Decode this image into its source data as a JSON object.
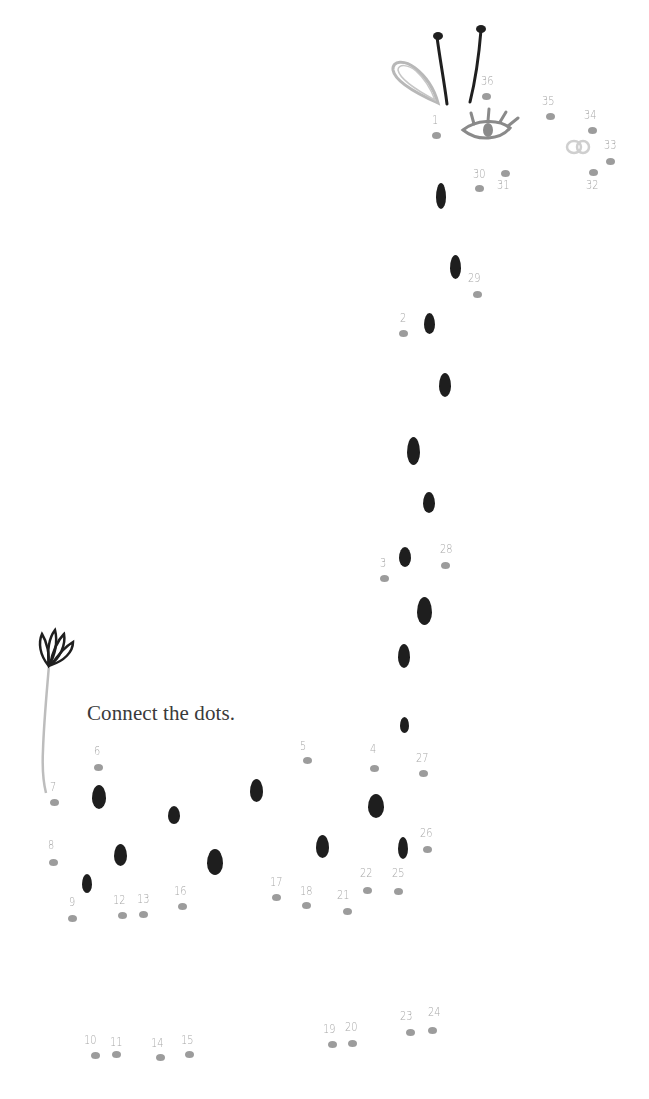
{
  "instruction": "Connect the dots.",
  "colors": {
    "dot": "#9c9c9c",
    "number": "#a8a8a8",
    "spot": "#1e1e1e",
    "text": "#3a3a3a",
    "background": "#ffffff"
  },
  "dots": [
    {
      "n": "1",
      "x": 436,
      "y": 135,
      "lx": 432,
      "ly": 113
    },
    {
      "n": "2",
      "x": 403,
      "y": 333,
      "lx": 400,
      "ly": 311
    },
    {
      "n": "3",
      "x": 384,
      "y": 578,
      "lx": 380,
      "ly": 556
    },
    {
      "n": "4",
      "x": 374,
      "y": 768,
      "lx": 370,
      "ly": 742
    },
    {
      "n": "5",
      "x": 307,
      "y": 760,
      "lx": 300,
      "ly": 739
    },
    {
      "n": "6",
      "x": 98,
      "y": 767,
      "lx": 94,
      "ly": 744
    },
    {
      "n": "7",
      "x": 54,
      "y": 802,
      "lx": 50,
      "ly": 780
    },
    {
      "n": "8",
      "x": 53,
      "y": 862,
      "lx": 48,
      "ly": 838
    },
    {
      "n": "9",
      "x": 72,
      "y": 918,
      "lx": 69,
      "ly": 895
    },
    {
      "n": "10",
      "x": 95,
      "y": 1055,
      "lx": 84,
      "ly": 1033
    },
    {
      "n": "11",
      "x": 116,
      "y": 1054,
      "lx": 110,
      "ly": 1035
    },
    {
      "n": "12",
      "x": 122,
      "y": 915,
      "lx": 113,
      "ly": 893
    },
    {
      "n": "13",
      "x": 143,
      "y": 914,
      "lx": 137,
      "ly": 892
    },
    {
      "n": "14",
      "x": 160,
      "y": 1057,
      "lx": 151,
      "ly": 1036
    },
    {
      "n": "15",
      "x": 189,
      "y": 1054,
      "lx": 181,
      "ly": 1033
    },
    {
      "n": "16",
      "x": 182,
      "y": 906,
      "lx": 174,
      "ly": 884
    },
    {
      "n": "17",
      "x": 276,
      "y": 897,
      "lx": 270,
      "ly": 875
    },
    {
      "n": "18",
      "x": 306,
      "y": 905,
      "lx": 300,
      "ly": 884
    },
    {
      "n": "19",
      "x": 332,
      "y": 1044,
      "lx": 323,
      "ly": 1022
    },
    {
      "n": "20",
      "x": 352,
      "y": 1043,
      "lx": 345,
      "ly": 1020
    },
    {
      "n": "21",
      "x": 347,
      "y": 911,
      "lx": 337,
      "ly": 888
    },
    {
      "n": "22",
      "x": 367,
      "y": 890,
      "lx": 360,
      "ly": 866
    },
    {
      "n": "23",
      "x": 410,
      "y": 1032,
      "lx": 400,
      "ly": 1009
    },
    {
      "n": "24",
      "x": 432,
      "y": 1030,
      "lx": 428,
      "ly": 1005
    },
    {
      "n": "25",
      "x": 398,
      "y": 891,
      "lx": 392,
      "ly": 866
    },
    {
      "n": "26",
      "x": 427,
      "y": 849,
      "lx": 420,
      "ly": 826
    },
    {
      "n": "27",
      "x": 423,
      "y": 773,
      "lx": 416,
      "ly": 751
    },
    {
      "n": "28",
      "x": 445,
      "y": 565,
      "lx": 440,
      "ly": 542
    },
    {
      "n": "29",
      "x": 477,
      "y": 294,
      "lx": 468,
      "ly": 271
    },
    {
      "n": "30",
      "x": 479,
      "y": 188,
      "lx": 473,
      "ly": 167
    },
    {
      "n": "31",
      "x": 505,
      "y": 173,
      "lx": 497,
      "ly": 178
    },
    {
      "n": "32",
      "x": 593,
      "y": 172,
      "lx": 586,
      "ly": 178
    },
    {
      "n": "33",
      "x": 610,
      "y": 161,
      "lx": 604,
      "ly": 138
    },
    {
      "n": "34",
      "x": 592,
      "y": 130,
      "lx": 584,
      "ly": 108
    },
    {
      "n": "35",
      "x": 550,
      "y": 116,
      "lx": 542,
      "ly": 94
    },
    {
      "n": "36",
      "x": 486,
      "y": 96,
      "lx": 481,
      "ly": 74
    }
  ],
  "spots": [
    {
      "x": 441,
      "y": 196,
      "w": 10,
      "h": 26
    },
    {
      "x": 455,
      "y": 267,
      "w": 11,
      "h": 24
    },
    {
      "x": 429,
      "y": 323,
      "w": 11,
      "h": 21
    },
    {
      "x": 445,
      "y": 385,
      "w": 12,
      "h": 24
    },
    {
      "x": 413,
      "y": 451,
      "w": 13,
      "h": 28
    },
    {
      "x": 429,
      "y": 502,
      "w": 12,
      "h": 21
    },
    {
      "x": 405,
      "y": 557,
      "w": 12,
      "h": 20
    },
    {
      "x": 424,
      "y": 611,
      "w": 15,
      "h": 28
    },
    {
      "x": 404,
      "y": 656,
      "w": 12,
      "h": 24
    },
    {
      "x": 404,
      "y": 725,
      "w": 9,
      "h": 16
    },
    {
      "x": 376,
      "y": 806,
      "w": 16,
      "h": 24
    },
    {
      "x": 403,
      "y": 848,
      "w": 10,
      "h": 22
    },
    {
      "x": 322,
      "y": 846,
      "w": 13,
      "h": 23
    },
    {
      "x": 256,
      "y": 790,
      "w": 13,
      "h": 23
    },
    {
      "x": 215,
      "y": 862,
      "w": 16,
      "h": 26
    },
    {
      "x": 174,
      "y": 815,
      "w": 12,
      "h": 18
    },
    {
      "x": 99,
      "y": 797,
      "w": 14,
      "h": 24
    },
    {
      "x": 120,
      "y": 855,
      "w": 13,
      "h": 22
    },
    {
      "x": 87,
      "y": 883,
      "w": 10,
      "h": 19
    }
  ]
}
